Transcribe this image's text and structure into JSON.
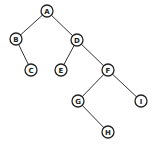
{
  "diagram": {
    "type": "binary-tree",
    "nodes": [
      {
        "id": "A",
        "label": "A",
        "x": 47,
        "y": 11
      },
      {
        "id": "B",
        "label": "B",
        "x": 16,
        "y": 39
      },
      {
        "id": "C",
        "label": "C",
        "x": 31,
        "y": 70
      },
      {
        "id": "D",
        "label": "D",
        "x": 77,
        "y": 40
      },
      {
        "id": "E",
        "label": "E",
        "x": 61,
        "y": 70
      },
      {
        "id": "F",
        "label": "F",
        "x": 108,
        "y": 70
      },
      {
        "id": "G",
        "label": "G",
        "x": 78,
        "y": 101
      },
      {
        "id": "I",
        "label": "I",
        "x": 141,
        "y": 101
      },
      {
        "id": "H",
        "label": "H",
        "x": 108,
        "y": 132
      }
    ],
    "edges": [
      [
        "A",
        "B"
      ],
      [
        "A",
        "D"
      ],
      [
        "B",
        "C"
      ],
      [
        "D",
        "E"
      ],
      [
        "D",
        "F"
      ],
      [
        "F",
        "G"
      ],
      [
        "F",
        "I"
      ],
      [
        "G",
        "H"
      ]
    ],
    "node_radius": 6,
    "colors": {
      "stroke": "#222222",
      "fill": "#ffffff",
      "edge": "#333333"
    }
  }
}
